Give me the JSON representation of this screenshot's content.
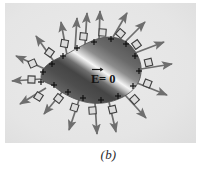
{
  "figure": {
    "caption": "(b)",
    "panel": {
      "background_color": "#e6e6e6",
      "width": 191,
      "height": 140
    },
    "conductor": {
      "name": "charged-conductor-blob",
      "fill_dark": "#4a4a4a",
      "fill_mid": "#7d7d7d",
      "fill_highlight": "#f2f2f2",
      "interior_label": "E = 0",
      "interior_label_symbol": "E",
      "interior_label_rest": " = 0",
      "vector_notation": "arrow-over-E",
      "outline_color": "#585858"
    },
    "charges": {
      "symbol": "+",
      "count": 16,
      "description": "positive surface charges distributed on conductor surface",
      "positions": [
        {
          "x": 38,
          "y": 69
        },
        {
          "x": 36,
          "y": 79
        },
        {
          "x": 47,
          "y": 61
        },
        {
          "x": 58,
          "y": 53
        },
        {
          "x": 72,
          "y": 45
        },
        {
          "x": 89,
          "y": 38
        },
        {
          "x": 106,
          "y": 35
        },
        {
          "x": 121,
          "y": 40
        },
        {
          "x": 130,
          "y": 52
        },
        {
          "x": 134,
          "y": 68
        },
        {
          "x": 128,
          "y": 83
        },
        {
          "x": 113,
          "y": 94
        },
        {
          "x": 96,
          "y": 99
        },
        {
          "x": 78,
          "y": 97
        },
        {
          "x": 63,
          "y": 90
        },
        {
          "x": 49,
          "y": 82
        }
      ]
    },
    "field_arrows": {
      "name": "electric-field-lines",
      "count": 18,
      "color": "#6b6b6b",
      "description": "field vectors pointing radially outward, perpendicular to surface",
      "vectors": [
        {
          "x1": 40,
          "y1": 66,
          "x2": 10,
          "y2": 52
        },
        {
          "x1": 36,
          "y1": 76,
          "x2": 6,
          "y2": 78
        },
        {
          "x1": 40,
          "y1": 85,
          "x2": 14,
          "y2": 101
        },
        {
          "x1": 50,
          "y1": 60,
          "x2": 30,
          "y2": 32
        },
        {
          "x1": 62,
          "y1": 52,
          "x2": 56,
          "y2": 18
        },
        {
          "x1": 70,
          "y1": 46,
          "x2": 72,
          "y2": 14
        },
        {
          "x1": 80,
          "y1": 42,
          "x2": 82,
          "y2": 9
        },
        {
          "x1": 94,
          "y1": 37,
          "x2": 95,
          "y2": 7
        },
        {
          "x1": 108,
          "y1": 34,
          "x2": 122,
          "y2": 9
        },
        {
          "x1": 120,
          "y1": 39,
          "x2": 140,
          "y2": 18
        },
        {
          "x1": 130,
          "y1": 50,
          "x2": 160,
          "y2": 38
        },
        {
          "x1": 136,
          "y1": 66,
          "x2": 168,
          "y2": 60
        },
        {
          "x1": 132,
          "y1": 80,
          "x2": 163,
          "y2": 92
        },
        {
          "x1": 120,
          "y1": 92,
          "x2": 142,
          "y2": 116
        },
        {
          "x1": 104,
          "y1": 99,
          "x2": 112,
          "y2": 130
        },
        {
          "x1": 90,
          "y1": 100,
          "x2": 92,
          "y2": 132
        },
        {
          "x1": 74,
          "y1": 97,
          "x2": 64,
          "y2": 128
        },
        {
          "x1": 58,
          "y1": 88,
          "x2": 38,
          "y2": 112
        }
      ]
    },
    "perpendicular_marks": {
      "name": "right-angle-marks",
      "count": 14,
      "description": "small square symbols indicating field is perpendicular to conductor surface",
      "color": "#4a4a4a"
    }
  }
}
